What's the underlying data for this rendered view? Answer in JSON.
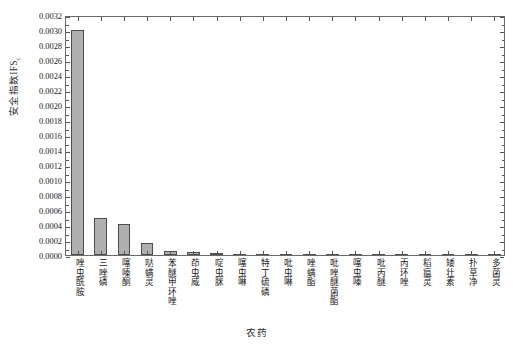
{
  "chart_data": {
    "type": "bar",
    "title": "",
    "xlabel": "农药",
    "ylabel": "安全指数IFS",
    "ylabel_sub": "c",
    "ylim": [
      0.0,
      0.0032
    ],
    "ytick_step": 0.0002,
    "ytick_labels": [
      "0.0032",
      "0.0030",
      "0.0028",
      "0.0026",
      "0.0024",
      "0.0022",
      "0.0020",
      "0.0018",
      "0.0016",
      "0.0014",
      "0.0012",
      "0.0010",
      "0.0008",
      "0.0006",
      "0.0004",
      "0.0002",
      "0.0000"
    ],
    "ytick_values": [
      0.0032,
      0.003,
      0.0028,
      0.0026,
      0.0024,
      0.0022,
      0.002,
      0.0018,
      0.0016,
      0.0014,
      0.0012,
      0.001,
      0.0008,
      0.0006,
      0.0004,
      0.0002,
      0.0
    ],
    "grid": false,
    "legend": "none",
    "bar_fill_color": "#b0b0b0",
    "bar_edge_color": "#4d4d4d",
    "categories": [
      "唑虫酰胺",
      "三唑磷",
      "噻嗪酮",
      "哒螨灵",
      "苯醚甲环唑",
      "茚虫威",
      "啶虫脒",
      "噻虫啉",
      "特丁硫磷",
      "吡虫啉",
      "唑螨酯",
      "吡唑醚菌酯",
      "噻虫嗪",
      "吡丙醚",
      "丙环唑",
      "稻瘟灵",
      "矮壮素",
      "扑草净",
      "多菌灵"
    ],
    "values": [
      0.003,
      0.00049,
      0.00041,
      0.00016,
      5e-05,
      3.5e-05,
      2.2e-05,
      1.8e-05,
      1.4e-05,
      1.2e-05,
      1e-05,
      9e-06,
      7e-06,
      6e-06,
      5e-06,
      4e-06,
      3e-06,
      2e-06,
      1e-06
    ]
  }
}
